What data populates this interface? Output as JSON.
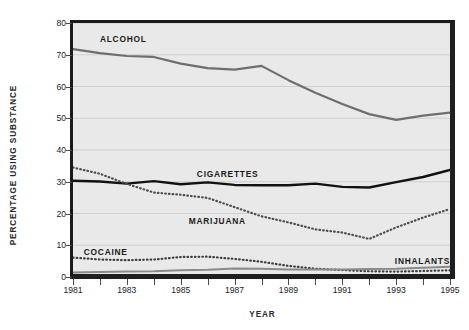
{
  "chart_data": {
    "type": "line",
    "title": "",
    "xlabel": "Year",
    "ylabel": "Percentage Using Substance",
    "xlim": [
      1981,
      1995
    ],
    "ylim": [
      0,
      80
    ],
    "grid": true,
    "legend_position": "inline-annotations",
    "x": [
      1981,
      1982,
      1983,
      1984,
      1985,
      1986,
      1987,
      1988,
      1989,
      1990,
      1991,
      1992,
      1993,
      1994,
      1995
    ],
    "x_tick_labels": [
      "1981",
      "1983",
      "1985",
      "1987",
      "1989",
      "1991",
      "1993",
      "1995"
    ],
    "x_tick_values": [
      1981,
      1983,
      1985,
      1987,
      1989,
      1991,
      1993,
      1995
    ],
    "x_minor_ticks": [
      1982,
      1984,
      1986,
      1988,
      1990,
      1992,
      1994
    ],
    "y_tick_labels": [
      "0",
      "10",
      "20",
      "30",
      "40",
      "50",
      "60",
      "70",
      "80"
    ],
    "y_tick_values": [
      0,
      10,
      20,
      30,
      40,
      50,
      60,
      70,
      80
    ],
    "series": [
      {
        "name": "Alcohol",
        "style": "solid",
        "color": "#6e6e6e",
        "width": 2.2,
        "label_x": 1982.0,
        "label_y": 76.5,
        "values": [
          71.8,
          70.5,
          69.6,
          69.3,
          67.2,
          65.8,
          65.3,
          66.5,
          62.0,
          58.0,
          54.5,
          51.3,
          49.5,
          50.8,
          51.8
        ]
      },
      {
        "name": "Cigarettes",
        "style": "solid",
        "color": "#111111",
        "width": 2.4,
        "label_x": 1985.6,
        "label_y": 34.0,
        "values": [
          30.3,
          30.1,
          29.4,
          30.2,
          29.2,
          29.8,
          29.0,
          28.9,
          28.9,
          29.4,
          28.4,
          28.2,
          29.9,
          31.5,
          33.7
        ]
      },
      {
        "name": "Marijuana",
        "style": "dotted",
        "color": "#4d4d4d",
        "width": 2.2,
        "label_x": 1985.3,
        "label_y": 19.3,
        "values": [
          34.5,
          32.5,
          29.3,
          26.6,
          25.9,
          24.9,
          22.0,
          19.1,
          17.2,
          15.0,
          14.0,
          12.0,
          15.6,
          18.7,
          21.4
        ]
      },
      {
        "name": "Cocaine",
        "style": "dotted",
        "color": "#3d3d3d",
        "width": 2.2,
        "label_x": 1981.4,
        "label_y": 9.3,
        "values": [
          6.1,
          5.5,
          5.3,
          5.5,
          6.3,
          6.4,
          5.7,
          4.8,
          3.5,
          2.6,
          2.2,
          1.8,
          1.7,
          1.9,
          2.1
        ]
      },
      {
        "name": "Inhalants",
        "style": "solid",
        "color": "#8a8a8a",
        "width": 2.0,
        "label_x": 1993.0,
        "label_y": 6.5,
        "values": [
          1.4,
          1.6,
          1.7,
          1.8,
          2.1,
          2.3,
          2.7,
          2.6,
          2.4,
          2.4,
          2.4,
          2.5,
          2.6,
          2.9,
          3.2
        ]
      }
    ]
  }
}
